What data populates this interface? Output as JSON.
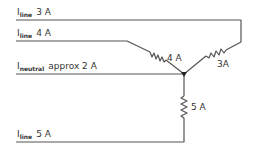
{
  "diagram": {
    "type": "three-phase-wye-circuit",
    "line_color": "#555555",
    "wires": [
      {
        "id": "line1",
        "symbol": "I",
        "subscript": "line",
        "value": "3 A"
      },
      {
        "id": "line2",
        "symbol": "I",
        "subscript": "line",
        "value": "4 A"
      },
      {
        "id": "neutral",
        "symbol": "I",
        "subscript": "neutral",
        "value": "approx 2 A"
      },
      {
        "id": "line3",
        "symbol": "I",
        "subscript": "line",
        "value": "5 A"
      }
    ],
    "loads": [
      {
        "id": "load-4a",
        "label": "4 A"
      },
      {
        "id": "load-3a",
        "label": "3A"
      },
      {
        "id": "load-5a",
        "label": "5 A"
      }
    ]
  }
}
